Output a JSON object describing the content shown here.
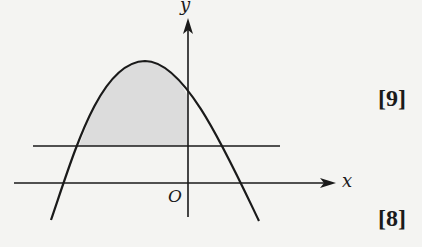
{
  "diagram": {
    "axes": {
      "x_label": "x",
      "y_label": "y",
      "origin_label": "O"
    },
    "curve": "downward parabola",
    "horizontal_line": "line parallel to x-axis above origin",
    "shaded_region": "area between curve and horizontal line, left of y-axis",
    "colors": {
      "stroke": "#1a1a1a",
      "shade": "#dcdcdc",
      "background": "#f4f4f2"
    }
  },
  "marks": {
    "first": "[9]",
    "second": "[8]"
  }
}
